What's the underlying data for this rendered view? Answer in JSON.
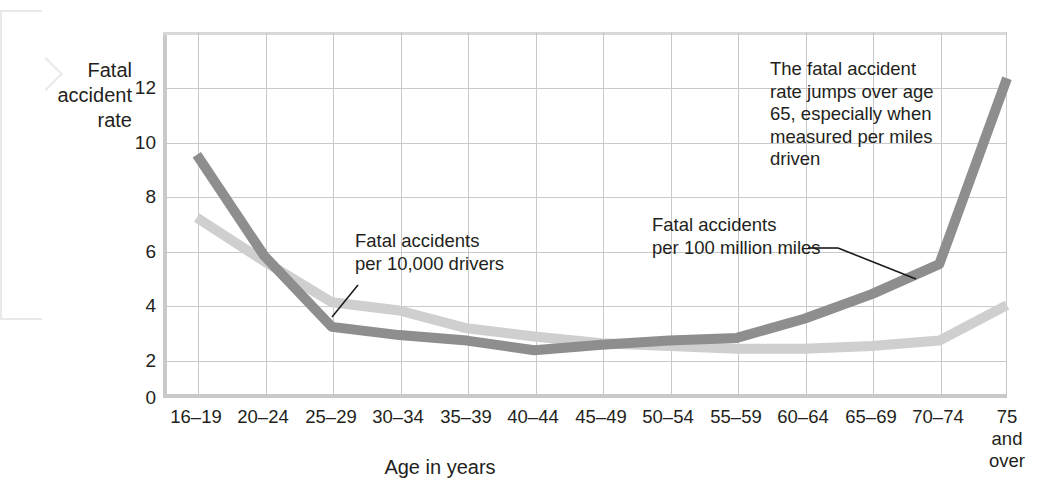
{
  "chart_data": {
    "type": "line",
    "title": "",
    "ylabel": "Fatal\naccident\nrate",
    "xlabel": "Age in years",
    "categories": [
      "16–19",
      "20–24",
      "25–29",
      "30–34",
      "35–39",
      "40–44",
      "45–49",
      "50–54",
      "55–59",
      "60–64",
      "65–69",
      "70–74",
      "75\nand\nover"
    ],
    "ylim": [
      0,
      13.4
    ],
    "yticks": [
      0,
      2,
      4,
      6,
      8,
      10,
      12
    ],
    "ytick_labels": [
      "0",
      "2",
      "4",
      "6",
      "8",
      "10",
      "12"
    ],
    "grid": true,
    "legend": "annotations",
    "series": [
      {
        "name": "Fatal accidents per 100 million miles",
        "color": "#8e8e8e",
        "values": [
          8.9,
          5.2,
          2.6,
          2.3,
          2.1,
          1.75,
          1.95,
          2.1,
          2.2,
          2.9,
          3.8,
          4.9,
          11.7
        ]
      },
      {
        "name": "Fatal accidents per 10,000 drivers",
        "color": "#cfcfcf",
        "values": [
          6.6,
          5.0,
          3.5,
          3.2,
          2.55,
          2.25,
          2.0,
          1.9,
          1.8,
          1.8,
          1.9,
          2.1,
          3.4
        ]
      }
    ],
    "annotations": [
      {
        "id": "annotation-age-65-jump",
        "text": "The fatal accident\nrate jumps over age\n65, especially when\nmeasured per miles\ndriven"
      },
      {
        "id": "annotation-per-10000-drivers",
        "text": "Fatal accidents\nper 10,000 drivers"
      },
      {
        "id": "annotation-per-100-million-miles",
        "text": "Fatal accidents\nper 100 million miles"
      }
    ],
    "colors": {
      "grid": "#c9c9c9",
      "axis": "#c9c9c9",
      "text": "#231f20",
      "series_dark": "#8e8e8e",
      "series_light": "#cfcfcf",
      "leader_line": "#1a1a1a"
    }
  }
}
